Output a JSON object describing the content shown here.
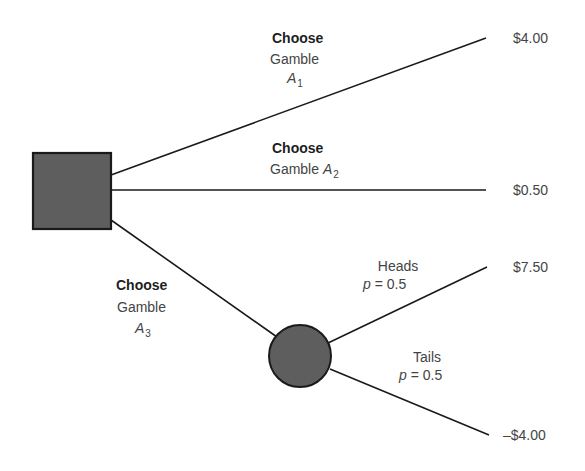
{
  "diagram": {
    "type": "decision-tree",
    "colors": {
      "node_fill": "#5e5e5e",
      "node_stroke": "#1a1a1a",
      "line": "#1a1a1a",
      "text": "#444444",
      "bold_text": "#1e1e1e"
    },
    "decision_node": {
      "shape": "square",
      "label": ""
    },
    "chance_node": {
      "shape": "circle",
      "label": ""
    },
    "branches": [
      {
        "action": "Choose",
        "gamble_word": "Gamble",
        "gamble_symbol": "A",
        "gamble_subscript": "1",
        "payoff": "$4.00"
      },
      {
        "action": "Choose",
        "gamble_word": "Gamble",
        "gamble_symbol": "A",
        "gamble_subscript": "2",
        "payoff": "$0.50"
      },
      {
        "action": "Choose",
        "gamble_word": "Gamble",
        "gamble_symbol": "A",
        "gamble_subscript": "3",
        "outcomes": [
          {
            "event": "Heads",
            "prob_symbol": "p",
            "prob_value": "= 0.5",
            "payoff": "$7.50"
          },
          {
            "event": "Tails",
            "prob_symbol": "p",
            "prob_value": "= 0.5",
            "payoff": "–$4.00"
          }
        ]
      }
    ]
  }
}
